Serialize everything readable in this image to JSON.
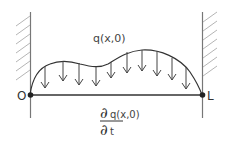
{
  "diagram": {
    "load_label": "q(x,0)",
    "left_end_label": "O",
    "right_end_label": "L",
    "derivative": {
      "numerator_symbol": "∂",
      "numerator_expr": "q(x,0)",
      "denominator_symbol": "∂",
      "denominator_var": "t"
    },
    "colors": {
      "line": "#333333",
      "hatch": "#aaaaaa",
      "wall": "#777777"
    },
    "arrow_count": 10
  }
}
